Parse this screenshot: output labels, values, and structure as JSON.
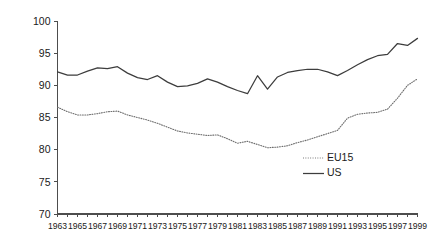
{
  "chart_data": {
    "type": "line",
    "title": "",
    "subtitle": "",
    "xlabel": "",
    "ylabel": "",
    "xlim": [
      1963,
      1999
    ],
    "ylim": [
      70,
      100
    ],
    "y_ticks": [
      70,
      75,
      80,
      85,
      90,
      95,
      100
    ],
    "y_tick_labels": [
      "70",
      "75",
      "80",
      "85",
      "90",
      "95",
      "100"
    ],
    "grid": false,
    "legend_position": "inside-right-lower",
    "x": [
      1963,
      1964,
      1965,
      1966,
      1967,
      1968,
      1969,
      1970,
      1971,
      1972,
      1973,
      1974,
      1975,
      1976,
      1977,
      1978,
      1979,
      1980,
      1981,
      1982,
      1983,
      1984,
      1985,
      1986,
      1987,
      1988,
      1989,
      1990,
      1991,
      1992,
      1993,
      1994,
      1995,
      1996,
      1997,
      1998,
      1999
    ],
    "x_tick_labels": [
      "1963",
      "1965",
      "1967",
      "1969",
      "1971",
      "1973",
      "1975",
      "1977",
      "1979",
      "1981",
      "1983",
      "1985",
      "1987",
      "1989",
      "1991",
      "1993",
      "1995",
      "1997",
      "1999"
    ],
    "x_tick_years": [
      1963,
      1965,
      1967,
      1969,
      1971,
      1973,
      1975,
      1977,
      1979,
      1981,
      1983,
      1985,
      1987,
      1989,
      1991,
      1993,
      1995,
      1997,
      1999
    ],
    "series": [
      {
        "name": "EU15",
        "style": "dotted",
        "color": "#6e6e6e",
        "values": [
          86.6,
          85.9,
          85.4,
          85.4,
          85.6,
          85.9,
          86.0,
          85.4,
          85.0,
          84.6,
          84.1,
          83.5,
          82.9,
          82.6,
          82.4,
          82.2,
          82.3,
          81.7,
          81.0,
          81.3,
          80.8,
          80.3,
          80.4,
          80.6,
          81.1,
          81.5,
          82.0,
          82.5,
          83.0,
          84.9,
          85.5,
          85.7,
          85.8,
          86.3,
          88.0,
          90.0,
          91.0
        ]
      },
      {
        "name": "US",
        "style": "solid",
        "color": "#3d3d3d",
        "values": [
          92.1,
          91.6,
          91.6,
          92.2,
          92.7,
          92.6,
          92.9,
          91.9,
          91.2,
          90.9,
          91.5,
          90.5,
          89.8,
          89.9,
          90.3,
          91.0,
          90.5,
          89.8,
          89.2,
          88.7,
          91.5,
          89.4,
          91.3,
          92.0,
          92.3,
          92.5,
          92.5,
          92.1,
          91.5,
          92.3,
          93.2,
          94.0,
          94.6,
          94.8,
          96.5,
          96.2,
          97.3
        ]
      }
    ]
  },
  "legend": {
    "items": [
      {
        "label": "EU15",
        "style": "dotted"
      },
      {
        "label": "US",
        "style": "solid"
      }
    ]
  }
}
